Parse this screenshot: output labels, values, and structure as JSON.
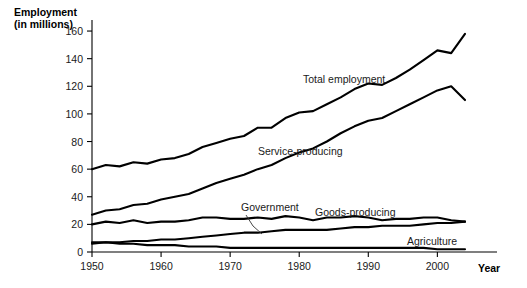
{
  "chart_data": {
    "type": "line",
    "title": "",
    "ylabel": "Employment\n(in millions)",
    "ylabel_line1": "Employment",
    "ylabel_line2": "(in millions)",
    "xlabel": "Year",
    "xlim": [
      1950,
      2004
    ],
    "ylim": [
      0,
      168
    ],
    "yticks": [
      0,
      20,
      40,
      60,
      80,
      100,
      120,
      140,
      160
    ],
    "xticks": [
      1950,
      1960,
      1970,
      1980,
      1990,
      2000
    ],
    "grid": false,
    "legend_position": "inline-annotations",
    "line_color": "#000000",
    "x": [
      1950,
      1952,
      1954,
      1956,
      1958,
      1960,
      1962,
      1964,
      1966,
      1968,
      1970,
      1972,
      1974,
      1976,
      1978,
      1980,
      1982,
      1984,
      1986,
      1988,
      1990,
      1992,
      1994,
      1996,
      1998,
      2000,
      2002,
      2004
    ],
    "series": [
      {
        "name": "Total employment",
        "label": "Total employment",
        "values": [
          60,
          63,
          62,
          65,
          64,
          67,
          68,
          71,
          76,
          79,
          82,
          84,
          90,
          90,
          97,
          101,
          102,
          107,
          112,
          118,
          122,
          121,
          126,
          132,
          139,
          146,
          144,
          158
        ]
      },
      {
        "name": "Service-producing",
        "label": "Service-producing",
        "values": [
          27,
          30,
          31,
          34,
          35,
          38,
          40,
          42,
          46,
          50,
          53,
          56,
          60,
          63,
          68,
          72,
          75,
          80,
          86,
          91,
          95,
          97,
          102,
          107,
          112,
          117,
          120,
          110
        ]
      },
      {
        "name": "Goods-producing",
        "label": "Goods-producing",
        "values": [
          20,
          22,
          21,
          23,
          21,
          22,
          22,
          23,
          25,
          25,
          24,
          24,
          25,
          24,
          26,
          25,
          23,
          25,
          25,
          26,
          25,
          23,
          24,
          24,
          25,
          25,
          23,
          22
        ]
      },
      {
        "name": "Government",
        "label": "Government",
        "values": [
          6,
          7,
          7,
          8,
          8,
          9,
          9,
          10,
          11,
          12,
          13,
          14,
          14,
          15,
          16,
          16,
          16,
          16,
          17,
          18,
          18,
          19,
          19,
          19,
          20,
          21,
          21,
          22
        ]
      },
      {
        "name": "Agriculture",
        "label": "Agriculture",
        "values": [
          7,
          7,
          6,
          6,
          5,
          5,
          5,
          4,
          4,
          4,
          3,
          3,
          3,
          3,
          3,
          3,
          3,
          3,
          3,
          3,
          3,
          3,
          3,
          3,
          3,
          2,
          2,
          2
        ]
      }
    ],
    "annotations": [
      {
        "text": "Total employment",
        "series": "Total employment"
      },
      {
        "text": "Service-producing",
        "series": "Service-producing"
      },
      {
        "text": "Goods-producing",
        "series": "Goods-producing"
      },
      {
        "text": "Government",
        "series": "Government"
      },
      {
        "text": "Agriculture",
        "series": "Agriculture"
      }
    ]
  }
}
